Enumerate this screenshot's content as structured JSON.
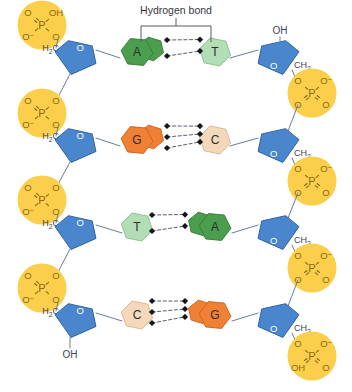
{
  "figure": {
    "title_annotation": "Hydrogen bond",
    "background_color": "#ffffff"
  },
  "colors": {
    "phosphate_fill": "#fbcf4b",
    "phosphate_text": "#8a6a12",
    "sugar_fill": "#4a86cd",
    "sugar_stroke": "#2f63a3",
    "sugar_text": "#1d4f8f",
    "adenine_fill": "#4a9e4d",
    "adenine_stroke": "#3b7f3e",
    "thymine_fill": "#b3ddb4",
    "thymine_stroke": "#8cc48e",
    "guanine_fill": "#ef8034",
    "guanine_stroke": "#d4671d",
    "cytosine_fill": "#f4d8bc",
    "cytosine_stroke": "#ddb992",
    "backbone_line": "#6b7e96",
    "hbond_line": "#55606e",
    "base_label_text": "#2b2b2b",
    "annotation_text": "#33373d",
    "bracket_line": "#555b63"
  },
  "labels": {
    "hydroxyl": "OH",
    "methylene": "CH",
    "methylene_sub": "2",
    "methylene_left_prefix": "H",
    "methylene_left_sub": "2",
    "methylene_left_main": "C",
    "phosphorus": "P",
    "oxygen": "O",
    "oxygen_anion": "O",
    "anion_mark": "-",
    "ring_oxygen": "O"
  },
  "base_pairs": [
    {
      "row": 1,
      "left_base": {
        "letter": "A",
        "name": "adenine",
        "type": "purine",
        "color_key": "adenine_fill"
      },
      "right_base": {
        "letter": "T",
        "name": "thymine",
        "type": "pyrimidine",
        "color_key": "thymine_fill"
      },
      "hydrogen_bonds": 2,
      "annotated": true
    },
    {
      "row": 2,
      "left_base": {
        "letter": "G",
        "name": "guanine",
        "type": "purine",
        "color_key": "guanine_fill"
      },
      "right_base": {
        "letter": "C",
        "name": "cytosine",
        "type": "pyrimidine",
        "color_key": "cytosine_fill"
      },
      "hydrogen_bonds": 3,
      "annotated": false
    },
    {
      "row": 3,
      "left_base": {
        "letter": "T",
        "name": "thymine",
        "type": "pyrimidine",
        "color_key": "thymine_fill"
      },
      "right_base": {
        "letter": "A",
        "name": "adenine",
        "type": "purine",
        "color_key": "adenine_fill"
      },
      "hydrogen_bonds": 2,
      "annotated": false
    },
    {
      "row": 4,
      "left_base": {
        "letter": "C",
        "name": "cytosine",
        "type": "pyrimidine",
        "color_key": "cytosine_fill"
      },
      "right_base": {
        "letter": "G",
        "name": "guanine",
        "type": "purine",
        "color_key": "guanine_fill"
      },
      "hydrogen_bonds": 3,
      "annotated": false
    }
  ],
  "left_backbone": {
    "strand_side": "left",
    "phosphates": [
      {
        "index": 1,
        "top_left": "O",
        "top_right": "OH",
        "bottom_left": "O-",
        "bottom_right": "O",
        "terminal": true
      },
      {
        "index": 2,
        "top_left": "O",
        "top_right": "O",
        "bottom_left": "O-",
        "bottom_right": "O",
        "terminal": false
      },
      {
        "index": 3,
        "top_left": "O",
        "top_right": "O",
        "bottom_left": "O-",
        "bottom_right": "O",
        "terminal": false
      },
      {
        "index": 4,
        "top_left": "O",
        "top_right": "O",
        "bottom_left": "O-",
        "bottom_right": "O",
        "terminal": false
      }
    ],
    "terminal_hydroxyl": "OH"
  },
  "right_backbone": {
    "strand_side": "right",
    "terminal_hydroxyl": "OH",
    "phosphates": [
      {
        "index": 1,
        "top_left": "O",
        "top_right": "O-",
        "bottom_left": "O",
        "bottom_right": "O",
        "terminal": false
      },
      {
        "index": 2,
        "top_left": "O",
        "top_right": "O-",
        "bottom_left": "O",
        "bottom_right": "O",
        "terminal": false
      },
      {
        "index": 3,
        "top_left": "O",
        "top_right": "O-",
        "bottom_left": "O",
        "bottom_right": "O",
        "terminal": false
      },
      {
        "index": 4,
        "top_left": "O",
        "top_right": "O-",
        "bottom_left": "OH",
        "bottom_right": "O",
        "terminal": true
      }
    ]
  }
}
